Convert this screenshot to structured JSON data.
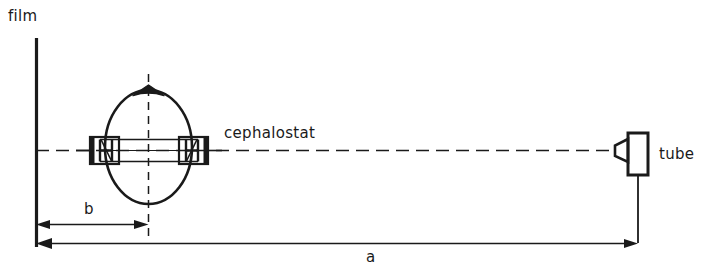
{
  "figure": {
    "type": "technical-diagram",
    "background_color": "#ffffff",
    "ink_color": "#1a1a1a",
    "width": 709,
    "height": 280
  },
  "labels": {
    "film": "film",
    "cephalostat": "cephalostat",
    "tube": "tube"
  },
  "dimensions": {
    "b_label": "b",
    "a_label": "a",
    "b_description": "film to head mid-sagittal plane distance",
    "a_description": "film to tube focal spot distance"
  },
  "components": {
    "film_plane": "vertical solid line at left",
    "head": "ellipse with nasal apex at top",
    "ear_rods": "left and right cephalostat ear rod blocks",
    "central_ray": "horizontal dash-dot line from film to tube",
    "head_axis": "vertical dash-dot line through head centre",
    "tube_housing": "rectangle with collimator cone and support stem"
  }
}
